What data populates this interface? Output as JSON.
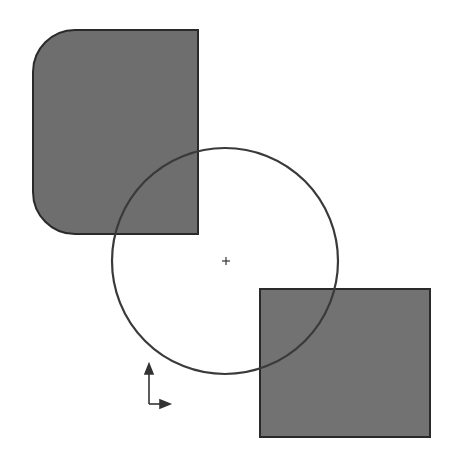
{
  "canvas": {
    "width": 460,
    "height": 458,
    "background": "#ffffff"
  },
  "colors": {
    "fill": "#6e6e6e",
    "stroke": "#2a2a2a",
    "circle_stroke": "#3a3a3a"
  },
  "shapes": {
    "rounded_rect": {
      "x": 33,
      "y": 30,
      "w": 165,
      "h": 204,
      "left_corner_radius": 42
    },
    "square": {
      "x": 260,
      "y": 289,
      "w": 170,
      "h": 148
    },
    "circle": {
      "cx": 225,
      "cy": 261,
      "r": 113
    },
    "center_mark": {
      "x": 226,
      "y": 261
    },
    "axis_triad": {
      "origin_x": 149,
      "origin_y": 404
    }
  }
}
